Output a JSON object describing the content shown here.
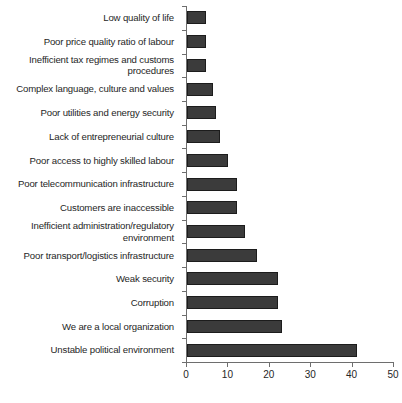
{
  "chart_data": {
    "type": "bar",
    "orientation": "horizontal",
    "title": "",
    "subtitle": "",
    "xlabel": "",
    "ylabel": "",
    "xlim": [
      0,
      50
    ],
    "xticks": [
      0,
      10,
      20,
      30,
      40,
      50
    ],
    "xtick_labels": [
      "0",
      "10",
      "20",
      "30",
      "40",
      "50"
    ],
    "grid": false,
    "legend": null,
    "bar_color": "#3b3b3b",
    "bar_edge_color": "#1c1c1c",
    "axis_color": "#6e6e6e",
    "background_color": "#ffffff",
    "text_color": "#262626",
    "categories": [
      "Low quality of life",
      "Poor price quality ratio of labour",
      "Inefficient tax regimes and customs\nprocedures",
      "Complex language, culture and values",
      "Poor utilities and energy security",
      "Lack of entrepreneurial culture",
      "Poor access to highly skilled labour",
      "Poor telecommunication infrastructure",
      "Customers are inaccessible",
      "Inefficient administration/regulatory\nenvironment",
      "Poor transport/logistics infrastructure",
      "Weak security",
      "Corruption",
      "We are a local organization",
      "Unstable political environment"
    ],
    "values": [
      4.5,
      4.5,
      4.5,
      6.3,
      7,
      8,
      10,
      12,
      12,
      14,
      17,
      22,
      22,
      23,
      41
    ]
  }
}
